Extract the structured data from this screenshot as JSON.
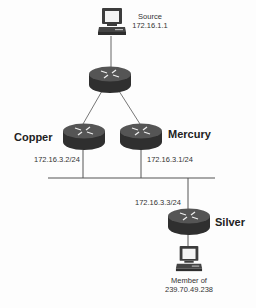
{
  "diagram": {
    "type": "network-topology",
    "nodes": {
      "source": {
        "kind": "workstation",
        "name": "Source",
        "address": "172.16.1.1"
      },
      "core_router": {
        "kind": "router"
      },
      "copper": {
        "kind": "router",
        "name": "Copper",
        "interface": "172.16.3.2/24"
      },
      "mercury": {
        "kind": "router",
        "name": "Mercury",
        "interface": "172.16.3.1/24"
      },
      "silver": {
        "kind": "router",
        "name": "Silver",
        "interface": "172.16.3.3/24"
      },
      "member": {
        "kind": "workstation",
        "line1": "Member of",
        "line2": "239.70.49.238"
      }
    },
    "links": [
      [
        "source",
        "core_router"
      ],
      [
        "core_router",
        "copper"
      ],
      [
        "core_router",
        "mercury"
      ],
      [
        "copper",
        "lan-segment"
      ],
      [
        "mercury",
        "lan-segment"
      ],
      [
        "silver",
        "lan-segment"
      ],
      [
        "silver",
        "member"
      ]
    ],
    "colors": {
      "wire": "#555555",
      "router_body": "#3a3a3a",
      "router_top": "#555555"
    }
  }
}
